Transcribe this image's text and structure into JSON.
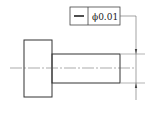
{
  "drawing": {
    "type": "engineering-drawing",
    "subject": "stepped shaft with straightness tolerance",
    "tolerance_frame": {
      "symbol": "straightness",
      "symbol_glyph": "—",
      "value": "ϕ0.01"
    },
    "colors": {
      "line": "#333333",
      "thin_line": "#555555",
      "background": "#ffffff"
    }
  }
}
